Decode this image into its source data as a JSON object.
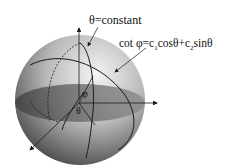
{
  "labels": {
    "theta_constant": "θ=constant",
    "cot_equation_prefix": "cot φ=c",
    "c1_sub": "1",
    "cos_part": "cosθ+c",
    "c2_sub": "2",
    "sin_part": "sinθ",
    "phi_symbol": "φ",
    "theta_symbol": "θ"
  },
  "colors": {
    "sphere_light": "#e8e8e8",
    "sphere_dark": "#3a3a3a",
    "equator_plane": "#6e6e6e",
    "lines": "#1a1a1a"
  }
}
